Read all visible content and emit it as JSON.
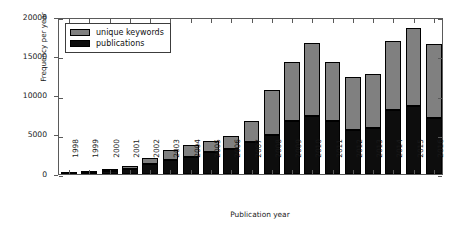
{
  "chart_data": {
    "type": "bar",
    "title": "",
    "subtitle": "",
    "xlabel": "Publication year",
    "ylabel": "Frequency per year",
    "stacked": true,
    "grid": false,
    "legend_position": "upper left",
    "ylim": [
      0,
      20000
    ],
    "yticks": [
      0,
      5000,
      10000,
      15000,
      20000
    ],
    "ytick_labels": [
      "0",
      "5000",
      "10000",
      "15000",
      "20000"
    ],
    "categories": [
      "1998",
      "1999",
      "2000",
      "2001",
      "2002",
      "2003",
      "2004",
      "2005",
      "2006",
      "2007",
      "2008",
      "2009",
      "2010",
      "2011",
      "2012",
      "2013",
      "2014",
      "2015",
      "2016"
    ],
    "series": [
      {
        "name": "publications",
        "color": "#0d0d0d",
        "values": [
          40,
          90,
          350,
          600,
          1250,
          1800,
          2150,
          2750,
          3150,
          4100,
          5000,
          6700,
          7400,
          6800,
          5600,
          5900,
          8100,
          8700,
          7100
        ]
      },
      {
        "name": "unique keywords",
        "color": "#808080",
        "values": [
          60,
          60,
          350,
          400,
          750,
          1200,
          1550,
          1450,
          1750,
          2600,
          5700,
          7600,
          9300,
          7500,
          6700,
          6800,
          8900,
          9900,
          9400
        ]
      }
    ],
    "totals": [
      100,
      150,
      700,
      1000,
      2000,
      3000,
      3700,
      4200,
      4900,
      6700,
      10700,
      14300,
      16700,
      14300,
      12300,
      12700,
      17000,
      18600,
      16500
    ]
  },
  "legend": {
    "items": [
      {
        "label": "unique keywords",
        "swatch": "#808080"
      },
      {
        "label": "publications",
        "swatch": "#0d0d0d"
      }
    ]
  }
}
